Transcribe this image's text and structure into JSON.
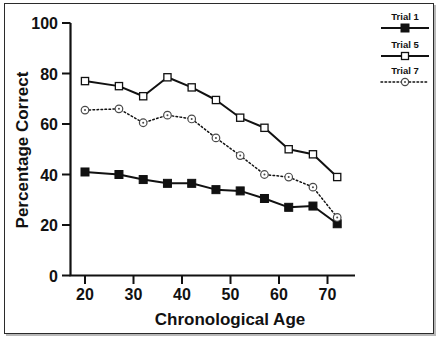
{
  "chart_data": {
    "type": "line",
    "title": "",
    "subtitle": "",
    "xlabel": "Chronological Age",
    "ylabel": "Percentage Correct",
    "xlim": [
      15,
      78
    ],
    "ylim": [
      0,
      100
    ],
    "xticks": [
      20,
      30,
      40,
      50,
      60,
      70
    ],
    "xticklabels": [
      "20",
      "30",
      "40",
      "50",
      "60",
      "70"
    ],
    "yticks": [
      0,
      20,
      40,
      60,
      80,
      100
    ],
    "yticklabels": [
      "0",
      "20",
      "40",
      "60",
      "80",
      "100"
    ],
    "grid": false,
    "legend_position": "outside-top-right",
    "x": [
      20,
      27,
      32,
      37,
      42,
      47,
      52,
      57,
      62,
      67,
      72
    ],
    "series": [
      {
        "name": "Trial 1",
        "marker": "filled-square",
        "linestyle": "solid",
        "color": "#111111",
        "values": [
          41,
          40,
          38,
          36.5,
          36.5,
          34,
          33.5,
          30.5,
          27,
          27.5,
          20.5
        ]
      },
      {
        "name": "Trial 5",
        "marker": "open-square",
        "linestyle": "solid",
        "color": "#111111",
        "values": [
          77,
          75,
          71,
          78.5,
          74.5,
          69.5,
          62.5,
          58.5,
          50,
          48,
          39
        ]
      },
      {
        "name": "Trial 7",
        "marker": "open-circle",
        "linestyle": "dotted",
        "color": "#111111",
        "values": [
          65.5,
          66,
          60.5,
          63.5,
          62,
          54.5,
          47.5,
          40,
          39,
          35,
          23
        ]
      }
    ]
  },
  "axes": {
    "y_title": "Percentage Correct",
    "x_title": "Chronological Age",
    "y_labels": [
      "100",
      "80",
      "60",
      "40",
      "20",
      "0"
    ],
    "x_labels": [
      "20",
      "30",
      "40",
      "50",
      "60",
      "70"
    ]
  },
  "legend": {
    "entries": [
      {
        "label": "Trial 1"
      },
      {
        "label": "Trial 5"
      },
      {
        "label": "Trial 7"
      }
    ]
  }
}
